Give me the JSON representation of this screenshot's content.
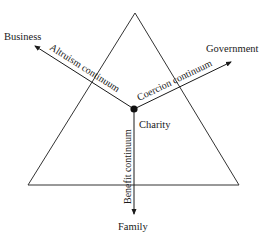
{
  "diagram": {
    "type": "triangle-continuum",
    "colors": {
      "line": "#333333",
      "text": "#1a1a1a",
      "background": "#ffffff"
    },
    "triangle": {
      "apex": [
        135,
        13
      ],
      "base_left": [
        28,
        185
      ],
      "base_right": [
        239,
        185
      ]
    },
    "center": {
      "x": 134,
      "y": 109,
      "label": "Charity"
    },
    "nodes": {
      "business": {
        "label": "Business",
        "x": 4,
        "y": 40
      },
      "government": {
        "label": "Government",
        "x": 206,
        "y": 52
      },
      "family": {
        "label": "Family",
        "x": 118,
        "y": 230
      }
    },
    "axes": [
      {
        "id": "altruism",
        "label": "Altruism continuum",
        "from": "Charity",
        "to": "Business"
      },
      {
        "id": "coercion",
        "label": "Coercion continuum",
        "from": "Charity",
        "to": "Government"
      },
      {
        "id": "benefit",
        "label": "Benefit continuum",
        "from": "Charity",
        "to": "Family"
      }
    ]
  }
}
